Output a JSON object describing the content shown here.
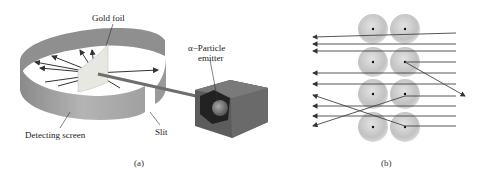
{
  "figure_a": {
    "caption": "(a)",
    "labels": {
      "gold_foil": "Gold foil",
      "emitter_line1": "α−Particle",
      "emitter_line2": "emitter",
      "detecting_screen": "Detecting screen",
      "slit": "Slit"
    }
  },
  "figure_b": {
    "caption": "(b)",
    "atoms": 8,
    "rows": 4,
    "columns": 2
  },
  "colors": {
    "screen": "#9a9a9a",
    "foil": "#e6e6e0",
    "box": "#5a5a5a",
    "arrow": "#333333",
    "atom": "#c4c4c4"
  }
}
